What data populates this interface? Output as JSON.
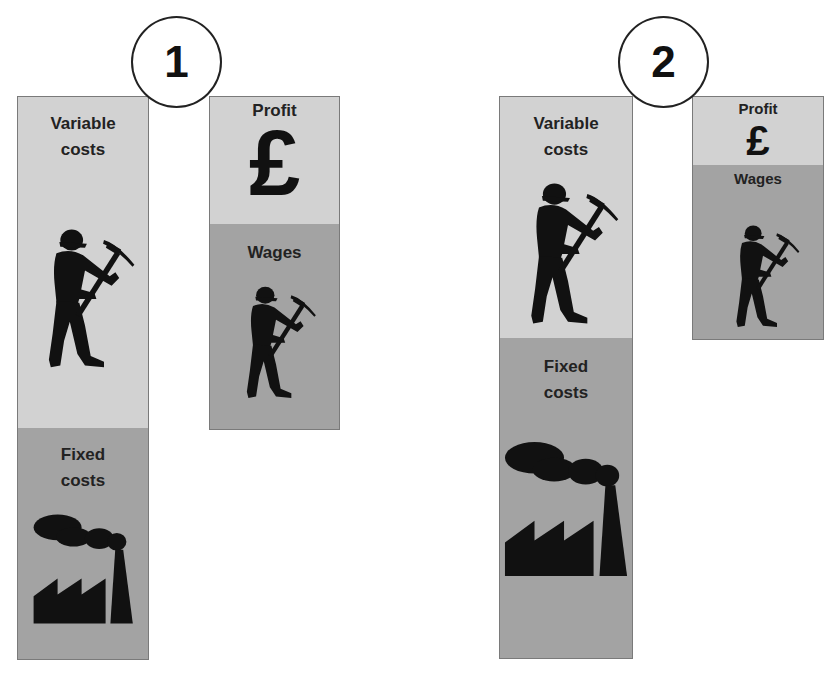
{
  "colors": {
    "variable_costs_fill": "#d2d2d2",
    "fixed_costs_fill": "#a3a3a3",
    "profit_fill": "#d2d2d2",
    "wages_fill": "#a3a3a3",
    "border": "#7a7a7a",
    "icon": "#111111"
  },
  "scenarios": [
    {
      "number": "1",
      "costs_column": {
        "segments": [
          {
            "label_line1": "Variable",
            "label_line2": "costs",
            "icon": "miner-with-pickaxe-icon"
          },
          {
            "label_line1": "Fixed",
            "label_line2": "costs",
            "icon": "factory-icon"
          }
        ]
      },
      "revenue_column": {
        "segments": [
          {
            "label": "Profit",
            "symbol": "£",
            "icon": "pound-sign-icon"
          },
          {
            "label": "Wages",
            "icon": "miner-with-pickaxe-icon"
          }
        ]
      }
    },
    {
      "number": "2",
      "costs_column": {
        "segments": [
          {
            "label_line1": "Variable",
            "label_line2": "costs",
            "icon": "miner-with-pickaxe-icon"
          },
          {
            "label_line1": "Fixed",
            "label_line2": "costs",
            "icon": "factory-icon"
          }
        ]
      },
      "revenue_column": {
        "segments": [
          {
            "label": "Profit",
            "symbol": "£",
            "icon": "pound-sign-icon"
          },
          {
            "label": "Wages",
            "icon": "miner-with-pickaxe-icon"
          }
        ]
      }
    }
  ]
}
